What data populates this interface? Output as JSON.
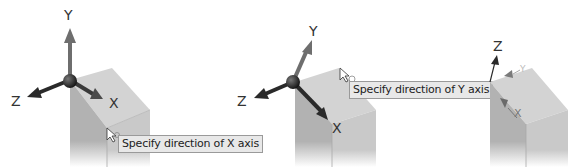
{
  "panels": [
    {
      "id": "x-axis-step",
      "axis_labels": {
        "y": "Y",
        "z": "Z",
        "x": "X"
      },
      "tooltip": "Specify direction of X axis"
    },
    {
      "id": "y-axis-step",
      "axis_labels": {
        "y": "Y",
        "z": "Z",
        "x": "X"
      },
      "tooltip": "Specify direction of Y axis"
    },
    {
      "id": "result-step",
      "axis_labels": {
        "z": "Z",
        "y": "Y",
        "x": "X"
      }
    }
  ],
  "colors": {
    "background": "#ffffff",
    "block_top": "#d4d4d4",
    "block_left": "#b4b4b4",
    "block_right": "#c8c8c8",
    "axis_dark": "#2a2a2a",
    "axis_grey": "#6e6e6e",
    "tooltip_bg": "#e8e8e8",
    "tooltip_border": "#9a9a9a"
  }
}
